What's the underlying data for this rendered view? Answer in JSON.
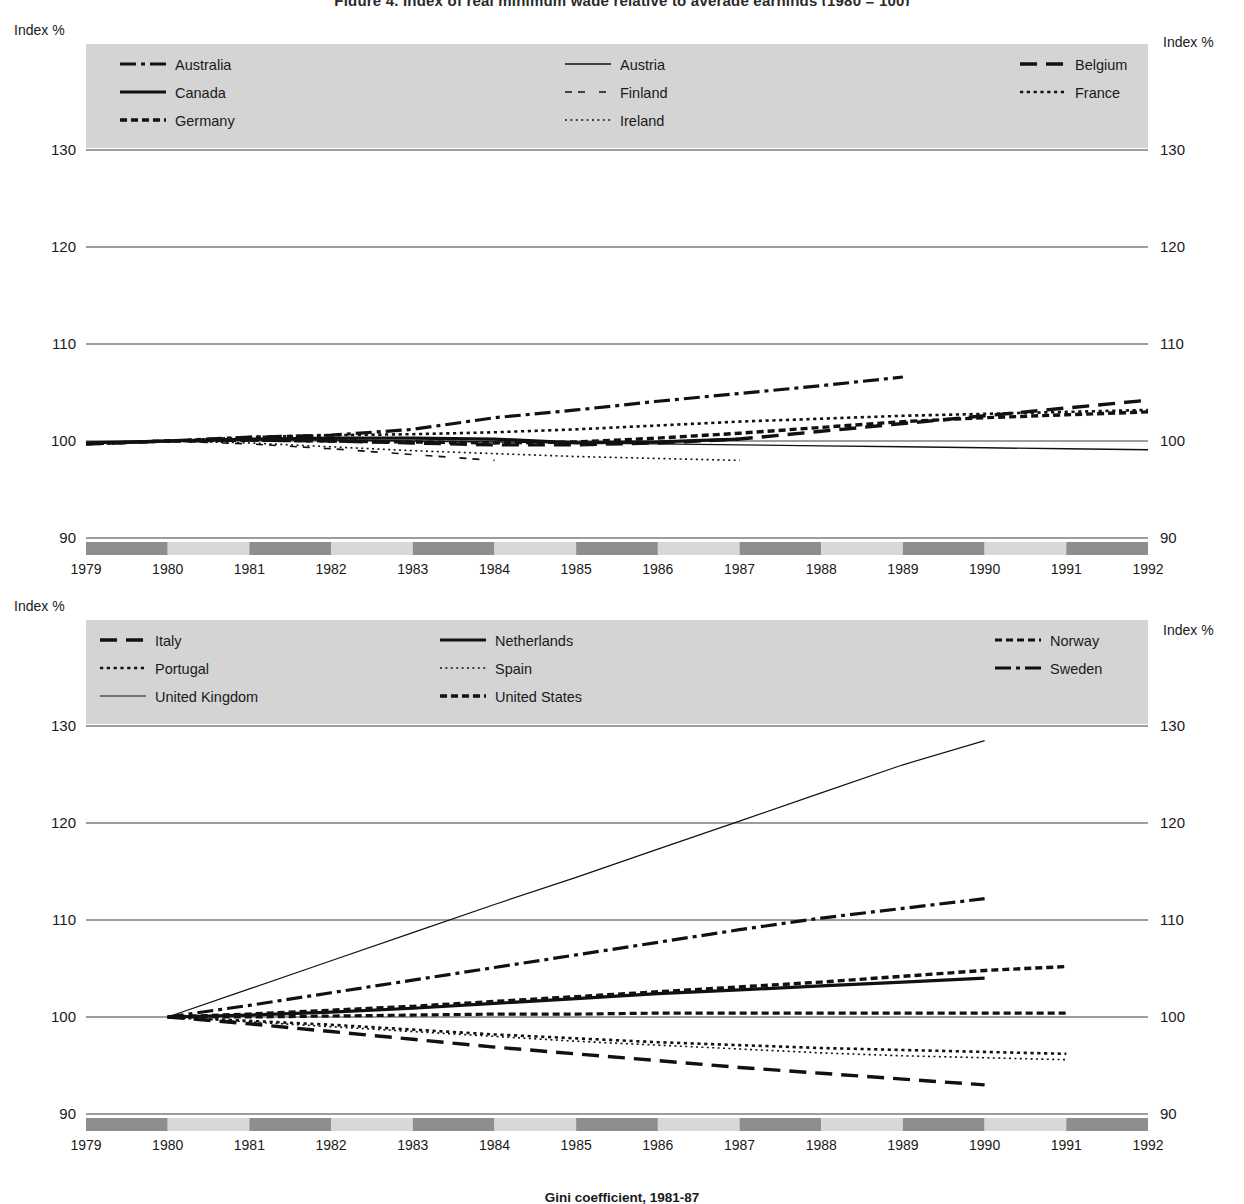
{
  "page": {
    "top_title": "Figure 4. Index of real minimum wage relative to average earnings (1980 = 100)",
    "bottom_caption": "Gini coefficient, 1981-87"
  },
  "axis": {
    "index_label": "Index %",
    "y_ticks": [
      130,
      120,
      110,
      100,
      90
    ],
    "y_tick_labels": [
      "130",
      "120",
      "110",
      "100",
      "90"
    ],
    "ylim": [
      90,
      130
    ],
    "years": [
      1979,
      1980,
      1981,
      1982,
      1983,
      1984,
      1985,
      1986,
      1987,
      1988,
      1989,
      1990,
      1991,
      1992
    ],
    "year_labels": [
      "1979",
      "1980",
      "1981",
      "1982",
      "1983",
      "1984",
      "1985",
      "1986",
      "1987",
      "1988",
      "1989",
      "1990",
      "1991",
      "1992"
    ],
    "xlim": [
      1979,
      1992
    ],
    "band_dark": "#8e8e8e",
    "band_light": "#d8d8d8"
  },
  "colors": {
    "line": "#111111",
    "grid": "#3c3c3c",
    "legend_bg": "#d4d4d4",
    "text": "#1a1a1a"
  },
  "chart_data": [
    {
      "type": "line",
      "title": "Index of real minimum wage (1980 = 100) — Australia to Ireland",
      "xlabel": "",
      "ylabel": "Index %",
      "ylim": [
        90,
        130
      ],
      "xlim": [
        1979,
        1992
      ],
      "grid": true,
      "legend_position": "top-inside",
      "legend_columns": 3,
      "legend_entries": [
        {
          "name": "Australia",
          "style": "dash-dot",
          "width": 3.2
        },
        {
          "name": "Austria",
          "style": "solid",
          "width": 1.4
        },
        {
          "name": "Belgium",
          "style": "long-dash",
          "width": 3.4
        },
        {
          "name": "Canada",
          "style": "solid",
          "width": 3.2
        },
        {
          "name": "Finland",
          "style": "loose-dash",
          "width": 1.6
        },
        {
          "name": "France",
          "style": "dotted",
          "width": 2.6
        },
        {
          "name": "Germany",
          "style": "thick-dash",
          "width": 3.4
        },
        {
          "name": "Ireland",
          "style": "fine-dotted",
          "width": 1.6
        }
      ],
      "series": [
        {
          "name": "Australia",
          "style": "dash-dot",
          "width": 3.2,
          "x": [
            1979,
            1980,
            1981,
            1982,
            1983,
            1984,
            1985,
            1986,
            1987,
            1988,
            1989
          ],
          "values": [
            99.7,
            100.0,
            100.4,
            100.6,
            101.2,
            102.4,
            103.2,
            104.1,
            104.9,
            105.7,
            106.6
          ]
        },
        {
          "name": "Austria",
          "style": "solid",
          "width": 1.4,
          "x": [
            1979,
            1980,
            1981,
            1982,
            1983,
            1984,
            1985,
            1986,
            1987,
            1988,
            1989,
            1990,
            1991,
            1992
          ],
          "values": [
            99.8,
            100.0,
            100.1,
            100.1,
            100.0,
            99.9,
            99.8,
            99.7,
            99.6,
            99.5,
            99.4,
            99.3,
            99.2,
            99.1
          ]
        },
        {
          "name": "Belgium",
          "style": "long-dash",
          "width": 3.4,
          "x": [
            1979,
            1980,
            1981,
            1982,
            1983,
            1984,
            1985,
            1986,
            1987,
            1988,
            1989,
            1990,
            1991,
            1992
          ],
          "values": [
            99.7,
            100.0,
            100.1,
            100.0,
            99.8,
            99.6,
            99.6,
            99.8,
            100.2,
            101.0,
            101.8,
            102.6,
            103.4,
            104.2
          ]
        },
        {
          "name": "Canada",
          "style": "solid",
          "width": 3.2,
          "x": [
            1979,
            1980,
            1981,
            1982,
            1983,
            1984,
            1985,
            1986,
            1987
          ],
          "values": [
            99.8,
            100.0,
            100.2,
            100.3,
            100.3,
            100.2,
            99.8,
            99.9,
            100.2
          ]
        },
        {
          "name": "Finland",
          "style": "loose-dash",
          "width": 1.6,
          "x": [
            1979,
            1980,
            1981,
            1982,
            1983,
            1984
          ],
          "values": [
            99.8,
            100.0,
            99.7,
            99.2,
            98.6,
            98.0
          ]
        },
        {
          "name": "France",
          "style": "dotted",
          "width": 2.6,
          "x": [
            1979,
            1980,
            1981,
            1982,
            1983,
            1984,
            1985,
            1986,
            1987,
            1988,
            1989,
            1990,
            1991,
            1992
          ],
          "values": [
            99.7,
            100.0,
            100.4,
            100.6,
            100.7,
            100.9,
            101.2,
            101.6,
            102.0,
            102.3,
            102.6,
            102.8,
            103.0,
            103.2
          ]
        },
        {
          "name": "Germany",
          "style": "thick-dash",
          "width": 3.4,
          "x": [
            1979,
            1980,
            1981,
            1982,
            1983,
            1984,
            1985,
            1986,
            1987,
            1988,
            1989,
            1990,
            1991,
            1992
          ],
          "values": [
            99.7,
            100.0,
            100.1,
            100.0,
            99.9,
            99.8,
            99.9,
            100.3,
            100.8,
            101.4,
            102.0,
            102.4,
            102.7,
            103.0
          ]
        },
        {
          "name": "Ireland",
          "style": "fine-dotted",
          "width": 1.6,
          "x": [
            1979,
            1980,
            1981,
            1982,
            1983,
            1984,
            1985,
            1986,
            1987
          ],
          "values": [
            99.8,
            100.0,
            99.8,
            99.4,
            99.0,
            98.7,
            98.4,
            98.2,
            98.0
          ]
        }
      ]
    },
    {
      "type": "line",
      "title": "Index of real minimum wage (1980 = 100) — Italy to United States",
      "xlabel": "",
      "ylabel": "Index %",
      "ylim": [
        90,
        130
      ],
      "xlim": [
        1979,
        1992
      ],
      "grid": true,
      "legend_position": "top-inside",
      "legend_columns": 3,
      "legend_entries": [
        {
          "name": "Italy",
          "style": "long-dash",
          "width": 3.4
        },
        {
          "name": "Netherlands",
          "style": "solid",
          "width": 3.2
        },
        {
          "name": "Norway",
          "style": "thick-dash",
          "width": 3.2
        },
        {
          "name": "Portugal",
          "style": "dotted",
          "width": 2.6
        },
        {
          "name": "Spain",
          "style": "fine-dotted",
          "width": 1.6
        },
        {
          "name": "Sweden",
          "style": "dash-dot",
          "width": 3.2
        },
        {
          "name": "United Kingdom",
          "style": "solid",
          "width": 1.2
        },
        {
          "name": "United States",
          "style": "thick-dash",
          "width": 3.4
        }
      ],
      "series": [
        {
          "name": "Italy",
          "style": "long-dash",
          "width": 3.4,
          "x": [
            1980,
            1981,
            1982,
            1983,
            1984,
            1985,
            1986,
            1987,
            1988,
            1989,
            1990
          ],
          "values": [
            100.0,
            99.3,
            98.5,
            97.7,
            96.9,
            96.2,
            95.5,
            94.8,
            94.2,
            93.6,
            93.0
          ]
        },
        {
          "name": "Netherlands",
          "style": "solid",
          "width": 3.2,
          "x": [
            1980,
            1981,
            1982,
            1983,
            1984,
            1985,
            1986,
            1987,
            1988,
            1989,
            1990
          ],
          "values": [
            100.0,
            100.2,
            100.5,
            100.9,
            101.4,
            101.9,
            102.4,
            102.8,
            103.2,
            103.6,
            104.0
          ]
        },
        {
          "name": "Norway",
          "style": "thick-dash",
          "width": 3.2,
          "x": [
            1980,
            1981,
            1982,
            1983,
            1984,
            1985,
            1986,
            1987,
            1988,
            1989,
            1990,
            1991
          ],
          "values": [
            100.0,
            100.0,
            100.1,
            100.2,
            100.3,
            100.3,
            100.4,
            100.4,
            100.4,
            100.4,
            100.4,
            100.4
          ]
        },
        {
          "name": "Portugal",
          "style": "dotted",
          "width": 2.6,
          "x": [
            1980,
            1981,
            1982,
            1983,
            1984,
            1985,
            1986,
            1987,
            1988,
            1989,
            1990,
            1991
          ],
          "values": [
            100.0,
            99.6,
            99.2,
            98.7,
            98.2,
            97.8,
            97.4,
            97.1,
            96.8,
            96.6,
            96.4,
            96.2
          ]
        },
        {
          "name": "Spain",
          "style": "fine-dotted",
          "width": 1.6,
          "x": [
            1980,
            1981,
            1982,
            1983,
            1984,
            1985,
            1986,
            1987,
            1988,
            1989,
            1990,
            1991
          ],
          "values": [
            100.0,
            99.5,
            99.0,
            98.5,
            98.0,
            97.5,
            97.1,
            96.7,
            96.3,
            96.0,
            95.8,
            95.6
          ]
        },
        {
          "name": "Sweden",
          "style": "dash-dot",
          "width": 3.2,
          "x": [
            1980,
            1981,
            1982,
            1983,
            1984,
            1985,
            1986,
            1987,
            1988,
            1989,
            1990
          ],
          "values": [
            100.0,
            101.2,
            102.5,
            103.8,
            105.1,
            106.4,
            107.7,
            109.0,
            110.2,
            111.2,
            112.2
          ]
        },
        {
          "name": "United Kingdom",
          "style": "solid",
          "width": 1.2,
          "x": [
            1980,
            1981,
            1982,
            1983,
            1984,
            1985,
            1986,
            1987,
            1988,
            1989,
            1990
          ],
          "values": [
            100.0,
            102.9,
            105.8,
            108.7,
            111.6,
            114.4,
            117.3,
            120.2,
            123.1,
            126.0,
            128.5
          ]
        },
        {
          "name": "United States",
          "style": "thick-dash",
          "width": 3.4,
          "x": [
            1980,
            1981,
            1982,
            1983,
            1984,
            1985,
            1986,
            1987,
            1988,
            1989,
            1990,
            1991
          ],
          "values": [
            100.0,
            100.3,
            100.7,
            101.1,
            101.6,
            102.1,
            102.6,
            103.1,
            103.6,
            104.2,
            104.8,
            105.2
          ]
        }
      ]
    }
  ]
}
